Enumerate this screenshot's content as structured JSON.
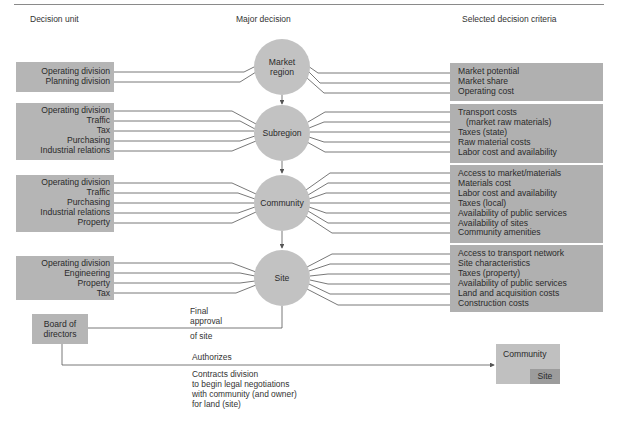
{
  "headers": {
    "decision_unit": "Decision unit",
    "major_decision": "Major decision",
    "criteria": "Selected decision criteria"
  },
  "stages": [
    {
      "decision_line1": "Market",
      "decision_line2": "region",
      "units": [
        "Operating division",
        "Planning division"
      ],
      "criteria": [
        "Market potential",
        "Market share",
        "Operating cost"
      ]
    },
    {
      "decision_line1": "Subregion",
      "decision_line2": "",
      "units": [
        "Operating division",
        "Traffic",
        "Tax",
        "Purchasing",
        "Industrial relations"
      ],
      "criteria": [
        "Transport costs",
        "(market raw materials)",
        "Taxes (state)",
        "Raw material costs",
        "Labor cost and availability"
      ]
    },
    {
      "decision_line1": "Community",
      "decision_line2": "",
      "units": [
        "Operating division",
        "Traffic",
        "Purchasing",
        "Industrial relations",
        "Property"
      ],
      "criteria": [
        "Access to market/materials",
        "Materials cost",
        "Labor cost and availability",
        "Taxes (local)",
        "Availability of public services",
        "Availability of sites",
        "Community amenities"
      ]
    },
    {
      "decision_line1": "Site",
      "decision_line2": "",
      "units": [
        "Operating division",
        "Engineering",
        "Property",
        "Tax"
      ],
      "criteria": [
        "Access to transport network",
        "Site characteristics",
        "Taxes (property)",
        "Availability of public services",
        "Land and acquisition costs",
        "Construction costs"
      ]
    }
  ],
  "board": {
    "line1": "Board of",
    "line2": "directors"
  },
  "final_approval": {
    "line1": "Final",
    "line2": "approval",
    "line3": "of site"
  },
  "authorizes": {
    "label": "Authorizes",
    "details": [
      "Contracts division",
      "to begin legal negotiations",
      "with community (and owner)",
      "for land (site)"
    ]
  },
  "target": {
    "outer": "Community",
    "inner": "Site"
  },
  "colors": {
    "box_gray": "#b5b5b5",
    "circle_gray": "#c2c2c2",
    "line": "#555555"
  }
}
